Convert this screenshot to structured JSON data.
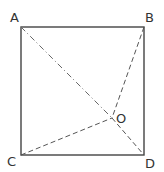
{
  "diagram": {
    "type": "geometry",
    "labels": {
      "A": "A",
      "B": "B",
      "C": "C",
      "D": "D",
      "O": "O"
    },
    "points": {
      "A": [
        21,
        27
      ],
      "B": [
        144,
        27
      ],
      "C": [
        21,
        155
      ],
      "D": [
        144,
        155
      ],
      "O": [
        112,
        118
      ]
    },
    "segments": [
      {
        "from": "A",
        "to": "B",
        "style": "solid"
      },
      {
        "from": "B",
        "to": "D",
        "style": "solid"
      },
      {
        "from": "D",
        "to": "C",
        "style": "solid"
      },
      {
        "from": "C",
        "to": "A",
        "style": "solid"
      },
      {
        "from": "A",
        "to": "O",
        "style": "dash-dot"
      },
      {
        "from": "O",
        "to": "D",
        "style": "dashed"
      },
      {
        "from": "B",
        "to": "O",
        "style": "dashed"
      },
      {
        "from": "C",
        "to": "O",
        "style": "dashed"
      }
    ],
    "colors": {
      "line": "#444444",
      "dashed": "#555555"
    }
  }
}
